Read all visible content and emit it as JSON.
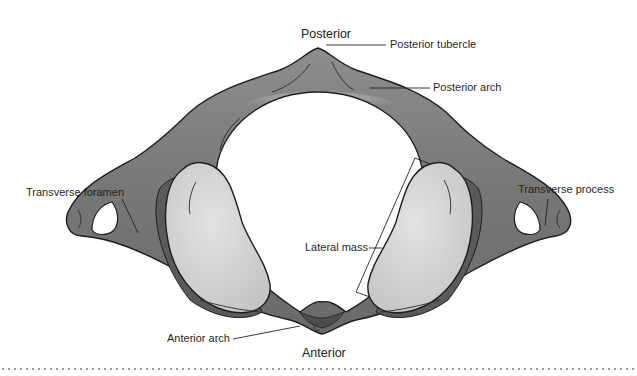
{
  "figure": {
    "colors": {
      "bone_dark": "#5a5a5a",
      "bone_mid": "#8a8a8a",
      "bone_light": "#b5b5b5",
      "facet": "#d6d6d6",
      "outline": "#1e1e1e",
      "text": "#1f1f1f",
      "dotted_rule": "#9a9a9a"
    }
  },
  "orientation": {
    "top": "Posterior",
    "bottom": "Anterior"
  },
  "labels": {
    "posterior_tubercle": "Posterior tubercle",
    "posterior_arch": "Posterior arch",
    "transverse_foramen": "Transverse foramen",
    "transverse_process": "Transverse process",
    "lateral_mass": "Lateral mass",
    "anterior_arch": "Anterior arch"
  }
}
